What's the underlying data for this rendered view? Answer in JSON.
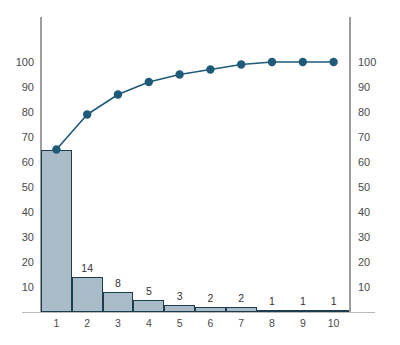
{
  "chart_data": {
    "type": "bar",
    "title": "",
    "subtitle": "",
    "xlabel": "",
    "ylabel": "",
    "y2label": "",
    "categories": [
      "1",
      "2",
      "3",
      "4",
      "5",
      "6",
      "7",
      "8",
      "9",
      "10"
    ],
    "values": [
      65,
      14,
      8,
      5,
      3,
      2,
      2,
      1,
      1,
      1
    ],
    "bar_labels": [
      "",
      "14",
      "8",
      "5",
      "3",
      "2",
      "2",
      "1",
      "1",
      "1"
    ],
    "series": [
      {
        "name": "Frequency",
        "type": "bar",
        "values": [
          65,
          14,
          8,
          5,
          3,
          2,
          2,
          1,
          1,
          1
        ]
      },
      {
        "name": "Cumulative percentage",
        "type": "line",
        "values": [
          65,
          79,
          87,
          92,
          95,
          97,
          99,
          100,
          100,
          100
        ]
      }
    ],
    "ylim": [
      0,
      100
    ],
    "y2lim": [
      0,
      100
    ],
    "xlim": [
      0.5,
      10.5
    ],
    "yticks": [
      10,
      20,
      30,
      40,
      50,
      60,
      70,
      80,
      90,
      100
    ],
    "y2ticks": [
      10,
      20,
      30,
      40,
      50,
      60,
      70,
      80,
      90,
      100
    ],
    "ytick_labels": [
      "10",
      "20",
      "30",
      "40",
      "50",
      "60",
      "70",
      "80",
      "90",
      "100"
    ],
    "y2tick_labels": [
      "10",
      "20",
      "30",
      "40",
      "50",
      "60",
      "70",
      "80",
      "90",
      "100"
    ],
    "xtick_labels": [
      "1",
      "2",
      "3",
      "4",
      "5",
      "6",
      "7",
      "8",
      "9",
      "10"
    ],
    "grid": false,
    "legend": "none",
    "annotations": [],
    "colors": {
      "bar_fill": "#aabcc8",
      "bar_border": "#1d3c4e",
      "line": "#1f5a78",
      "marker": "#1f5a78",
      "axis": "#9d9d9d",
      "baseline": "#b8b8b8",
      "tick_text": "#4a4a4a",
      "label_text": "#333333",
      "background": "#ffffff"
    }
  }
}
